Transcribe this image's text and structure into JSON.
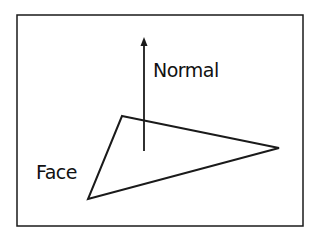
{
  "diagram": {
    "labels": {
      "normal": "Normal",
      "face": "Face"
    },
    "frame": {
      "x": 17,
      "y": 15,
      "width": 286,
      "height": 211
    },
    "face_triangle": {
      "points": [
        [
          122,
          116
        ],
        [
          279,
          148
        ],
        [
          88,
          199
        ]
      ]
    },
    "normal_arrow": {
      "from": [
        144,
        151
      ],
      "to": [
        144,
        38
      ]
    },
    "colors": {
      "stroke": "#1a1a1a",
      "background": "#ffffff"
    }
  }
}
